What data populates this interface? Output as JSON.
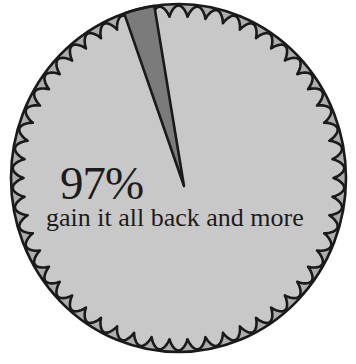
{
  "chart_data": {
    "type": "pie",
    "title": "",
    "categories": [
      "gain it all back and more",
      "other"
    ],
    "values": [
      97,
      3
    ],
    "labels": [
      {
        "value_text": "97%",
        "text": "gain it all back and more"
      }
    ],
    "legend": "none",
    "colors": {
      "main_slice": "#c8c8c8",
      "small_slice": "#7b7b7b",
      "border_teeth": "#adadad",
      "outline": "#1a1a1a"
    }
  },
  "labels": {
    "percent": "97%",
    "description": "gain it all back and more"
  }
}
